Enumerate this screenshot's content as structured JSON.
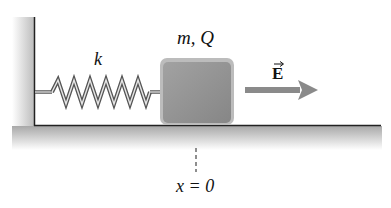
{
  "diagram": {
    "spring_label": "k",
    "block_label": "m, Q",
    "field_label": "E",
    "position_label": "x = 0",
    "colors": {
      "block": "#8f8f8f",
      "block_edge": "#b5b5b5",
      "arrow": "#8a8a8a",
      "wall_shade": "#c8c8c8",
      "line": "#222222"
    }
  }
}
